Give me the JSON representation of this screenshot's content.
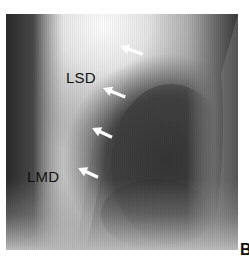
{
  "figure": {
    "panel_letter": "B",
    "labels": [
      {
        "id": "lsd",
        "text": "LSD"
      },
      {
        "id": "lmd",
        "text": "LMD"
      }
    ],
    "arrows": [
      {
        "id": "arrow-1",
        "direction": "down-left"
      },
      {
        "id": "arrow-2",
        "direction": "down-left"
      },
      {
        "id": "arrow-3",
        "direction": "down-left"
      },
      {
        "id": "arrow-4",
        "direction": "down-left"
      }
    ],
    "colors": {
      "background": "#ffffff",
      "bright_region": "#f4f4f4",
      "dark_region": "#3a3a3a",
      "text": "#111111",
      "arrow": "#ffffff"
    }
  }
}
